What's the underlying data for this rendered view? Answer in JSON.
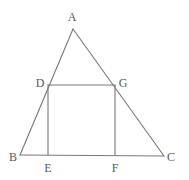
{
  "figure": {
    "canvas": {
      "width": 189,
      "height": 180,
      "background": "#ffffff"
    },
    "stroke_color": "#777777",
    "label_color": "#58585c",
    "points": {
      "A": {
        "label": "A",
        "x": 73,
        "y": 29,
        "label_x": 72,
        "label_y": 17
      },
      "B": {
        "label": "B",
        "x": 20,
        "y": 155,
        "label_x": 13,
        "label_y": 157
      },
      "C": {
        "label": "C",
        "x": 164,
        "y": 156,
        "label_x": 171,
        "label_y": 157
      },
      "D": {
        "label": "D",
        "x": 48,
        "y": 85,
        "label_x": 40,
        "label_y": 83
      },
      "E": {
        "label": "E",
        "x": 48,
        "y": 155,
        "label_x": 48,
        "label_y": 168
      },
      "F": {
        "label": "F",
        "x": 115,
        "y": 155,
        "label_x": 115,
        "label_y": 168
      },
      "G": {
        "label": "G",
        "x": 115,
        "y": 85,
        "label_x": 123,
        "label_y": 83
      }
    },
    "segments": [
      {
        "name": "side-AB",
        "from": "A",
        "to": "B"
      },
      {
        "name": "side-AC",
        "from": "A",
        "to": "C"
      },
      {
        "name": "base-BC",
        "from": "B",
        "to": "C"
      },
      {
        "name": "rect-top-DG",
        "from": "D",
        "to": "G"
      },
      {
        "name": "rect-left-DE",
        "from": "D",
        "to": "E"
      },
      {
        "name": "rect-right-GF",
        "from": "G",
        "to": "F"
      }
    ]
  }
}
